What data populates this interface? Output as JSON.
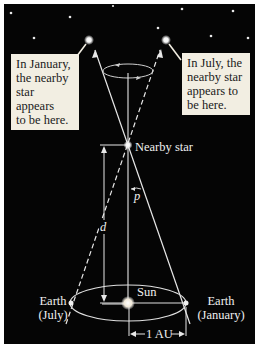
{
  "callouts": {
    "january": {
      "line1": "In January,",
      "line2": "the nearby",
      "line3": "star appears",
      "line4": "to be here."
    },
    "july": {
      "line1": "In July, the",
      "line2": "nearby star",
      "line3": "appears to",
      "line4": "be here."
    }
  },
  "labels": {
    "nearby_star": "Nearby star",
    "parallax_angle": "p",
    "distance": "d",
    "sun": "Sun",
    "earth_july_line1": "Earth",
    "earth_july_line2": "(July)",
    "earth_january_line1": "Earth",
    "earth_january_line2": "(January)",
    "au_scale": "1 AU"
  },
  "colors": {
    "background": "#050505",
    "lines": "#e8e8e8",
    "callout_bg": "#f2eee2",
    "callout_text": "#1a1a1a"
  }
}
